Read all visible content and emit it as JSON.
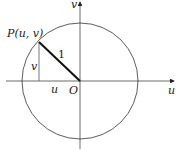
{
  "diagram": {
    "title": "",
    "labels": {
      "point": "P(u, v)",
      "radius": "1",
      "vertical_segment": "v",
      "horizontal_segment": "u",
      "origin": "O",
      "x_axis": "u",
      "y_axis": "v"
    },
    "elements": {
      "circle": {
        "center": [
          80,
          81
        ],
        "radius": 58,
        "stroke": "#333333"
      },
      "point_P": [
        39,
        42
      ],
      "radius_line_color": "#111111"
    }
  }
}
